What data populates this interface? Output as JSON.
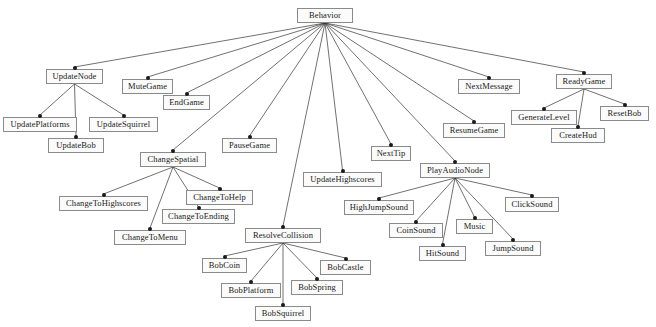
{
  "diagram": {
    "type": "tree",
    "background_color": "#ffffff",
    "node_fill_color": "#fbfbfb",
    "node_border_color": "#8a8a8a",
    "edge_color": "#333333",
    "text_color": "#1a1a1a",
    "nodes": [
      {
        "id": "behavior",
        "label": "Behavior",
        "x": 297,
        "y": 8,
        "w": 56
      },
      {
        "id": "updatenode",
        "label": "UpdateNode",
        "x": 46,
        "y": 69,
        "w": 57
      },
      {
        "id": "mutegame",
        "label": "MuteGame",
        "x": 122,
        "y": 79,
        "w": 51
      },
      {
        "id": "endgame",
        "label": "EndGame",
        "x": 163,
        "y": 95,
        "w": 47
      },
      {
        "id": "updateplatforms",
        "label": "UpdatePlatforms",
        "x": 3,
        "y": 117,
        "w": 74
      },
      {
        "id": "updatesquirrel",
        "label": "UpdateSquirrel",
        "x": 89,
        "y": 117,
        "w": 69
      },
      {
        "id": "updatebob",
        "label": "UpdateBob",
        "x": 48,
        "y": 138,
        "w": 56
      },
      {
        "id": "pausegame",
        "label": "PauseGame",
        "x": 222,
        "y": 138,
        "w": 55
      },
      {
        "id": "changespatial",
        "label": "ChangeSpatial",
        "x": 140,
        "y": 152,
        "w": 66
      },
      {
        "id": "nexttip",
        "label": "NextTip",
        "x": 371,
        "y": 146,
        "w": 40
      },
      {
        "id": "updatehighscores",
        "label": "UpdateHighscores",
        "x": 303,
        "y": 172,
        "w": 79
      },
      {
        "id": "nextmessage",
        "label": "NextMessage",
        "x": 458,
        "y": 79,
        "w": 62
      },
      {
        "id": "readygame",
        "label": "ReadyGame",
        "x": 556,
        "y": 74,
        "w": 56
      },
      {
        "id": "generatelevel",
        "label": "GenerateLevel",
        "x": 511,
        "y": 110,
        "w": 66
      },
      {
        "id": "resetbob",
        "label": "ResetBob",
        "x": 600,
        "y": 106,
        "w": 49
      },
      {
        "id": "createhud",
        "label": "CreateHud",
        "x": 551,
        "y": 128,
        "w": 54
      },
      {
        "id": "resumegame",
        "label": "ResumeGame",
        "x": 443,
        "y": 123,
        "w": 62
      },
      {
        "id": "playaudionode",
        "label": "PlayAudioNode",
        "x": 420,
        "y": 163,
        "w": 70
      },
      {
        "id": "changetohighscores",
        "label": "ChangeToHighscores",
        "x": 59,
        "y": 196,
        "w": 89
      },
      {
        "id": "changetohelp",
        "label": "ChangeToHelp",
        "x": 186,
        "y": 190,
        "w": 67
      },
      {
        "id": "changetoending",
        "label": "ChangeToEnding",
        "x": 162,
        "y": 209,
        "w": 73
      },
      {
        "id": "changetomenu",
        "label": "ChangeToMenu",
        "x": 114,
        "y": 230,
        "w": 72
      },
      {
        "id": "highjumpsound",
        "label": "HighJumpSound",
        "x": 344,
        "y": 200,
        "w": 70
      },
      {
        "id": "clicksound",
        "label": "ClickSound",
        "x": 505,
        "y": 197,
        "w": 54
      },
      {
        "id": "coinsound",
        "label": "CoinSound",
        "x": 389,
        "y": 223,
        "w": 54
      },
      {
        "id": "music",
        "label": "Music",
        "x": 456,
        "y": 219,
        "w": 37
      },
      {
        "id": "hitsound",
        "label": "HitSound",
        "x": 419,
        "y": 246,
        "w": 47
      },
      {
        "id": "jumpsound",
        "label": "JumpSound",
        "x": 485,
        "y": 241,
        "w": 56
      },
      {
        "id": "resolvecollision",
        "label": "ResolveCollision",
        "x": 245,
        "y": 228,
        "w": 76
      },
      {
        "id": "bobcoin",
        "label": "BobCoin",
        "x": 202,
        "y": 258,
        "w": 45
      },
      {
        "id": "bobcastle",
        "label": "BobCastle",
        "x": 320,
        "y": 260,
        "w": 51
      },
      {
        "id": "bobplatform",
        "label": "BobPlatform",
        "x": 221,
        "y": 283,
        "w": 60
      },
      {
        "id": "bobspring",
        "label": "BobSpring",
        "x": 291,
        "y": 280,
        "w": 52
      },
      {
        "id": "bobsquirrel",
        "label": "BobSquirrel",
        "x": 255,
        "y": 306,
        "w": 56
      }
    ],
    "edges": [
      {
        "from": "behavior",
        "to": "updatenode"
      },
      {
        "from": "behavior",
        "to": "mutegame"
      },
      {
        "from": "behavior",
        "to": "endgame"
      },
      {
        "from": "behavior",
        "to": "pausegame"
      },
      {
        "from": "behavior",
        "to": "changespatial"
      },
      {
        "from": "behavior",
        "to": "updatehighscores"
      },
      {
        "from": "behavior",
        "to": "nexttip"
      },
      {
        "from": "behavior",
        "to": "nextmessage"
      },
      {
        "from": "behavior",
        "to": "readygame"
      },
      {
        "from": "behavior",
        "to": "resumegame"
      },
      {
        "from": "behavior",
        "to": "playaudionode"
      },
      {
        "from": "behavior",
        "to": "resolvecollision"
      },
      {
        "from": "updatenode",
        "to": "updateplatforms"
      },
      {
        "from": "updatenode",
        "to": "updatebob"
      },
      {
        "from": "updatenode",
        "to": "updatesquirrel"
      },
      {
        "from": "changespatial",
        "to": "changetohighscores"
      },
      {
        "from": "changespatial",
        "to": "changetomenu"
      },
      {
        "from": "changespatial",
        "to": "changetoending"
      },
      {
        "from": "changespatial",
        "to": "changetohelp"
      },
      {
        "from": "readygame",
        "to": "generatelevel"
      },
      {
        "from": "readygame",
        "to": "createhud"
      },
      {
        "from": "readygame",
        "to": "resetbob"
      },
      {
        "from": "playaudionode",
        "to": "highjumpsound"
      },
      {
        "from": "playaudionode",
        "to": "coinsound"
      },
      {
        "from": "playaudionode",
        "to": "hitsound"
      },
      {
        "from": "playaudionode",
        "to": "music"
      },
      {
        "from": "playaudionode",
        "to": "jumpsound"
      },
      {
        "from": "playaudionode",
        "to": "clicksound"
      },
      {
        "from": "resolvecollision",
        "to": "bobcoin"
      },
      {
        "from": "resolvecollision",
        "to": "bobplatform"
      },
      {
        "from": "resolvecollision",
        "to": "bobsquirrel"
      },
      {
        "from": "resolvecollision",
        "to": "bobspring"
      },
      {
        "from": "resolvecollision",
        "to": "bobcastle"
      }
    ]
  }
}
